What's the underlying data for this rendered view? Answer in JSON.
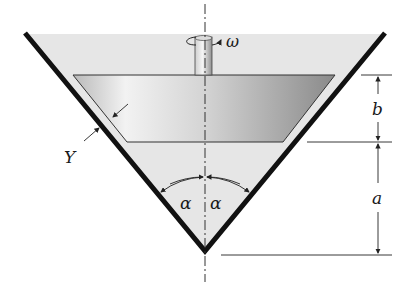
{
  "figure": {
    "labels": {
      "omega": "ω",
      "gap": "Y",
      "height_frustum": "b",
      "height_apex": "a",
      "half_angle_left": "α",
      "half_angle_right": "α"
    },
    "colors": {
      "wall": "#111111",
      "fluid": "#e6e6e6",
      "body_light": "#f4f4f4",
      "body_dark": "#8e8e8e",
      "line": "#222222"
    }
  }
}
